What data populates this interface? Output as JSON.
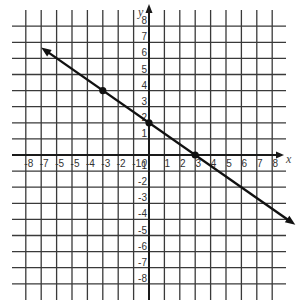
{
  "chart_data": {
    "type": "line",
    "title": "",
    "xlabel": "x",
    "ylabel": "y",
    "xlim": [
      -8,
      8
    ],
    "ylim": [
      -8,
      8
    ],
    "grid": true,
    "x_ticks": [
      "-8",
      "-7",
      "-6",
      "-5",
      "-4",
      "-3",
      "-2",
      "-1",
      "0",
      "1",
      "2",
      "3",
      "4",
      "5",
      "6",
      "7",
      "8"
    ],
    "x_tick_labels_as_printed": [
      "-8",
      "-7",
      "-5",
      "-5",
      "-4",
      "-3",
      "-2",
      "-1",
      "0",
      "1",
      "2",
      "3",
      "4",
      "5",
      "6",
      "7",
      "8"
    ],
    "y_ticks": [
      "8",
      "7",
      "6",
      "5",
      "4",
      "3",
      "2",
      "1",
      "-1",
      "-2",
      "-3",
      "-4",
      "-5",
      "-6",
      "-7",
      "-8"
    ],
    "series": [
      {
        "name": "line",
        "equation": "y = -2/3 x + 2",
        "slope": -0.6667,
        "intercept": 2,
        "arrows": "both",
        "extent": {
          "x_start": -7,
          "y_start": 6.67,
          "x_end": 9.5,
          "y_end": -4.33
        }
      }
    ],
    "points": [
      {
        "x": -3,
        "y": 4
      },
      {
        "x": 0,
        "y": 2
      },
      {
        "x": 3,
        "y": 0
      }
    ],
    "colors": {
      "grid": "#3a3a3a",
      "axis": "#1a1a1a",
      "line": "#111111",
      "point": "#111111"
    }
  }
}
